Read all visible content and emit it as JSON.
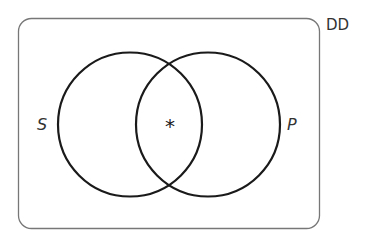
{
  "diagram": {
    "type": "venn",
    "universe_label": "DD",
    "sets": [
      {
        "name": "S",
        "label": "S"
      },
      {
        "name": "P",
        "label": "P"
      }
    ],
    "intersection_marker": "*",
    "colors": {
      "circle_stroke": "#1a1a1a",
      "rect_stroke": "#777777",
      "text": "#333333"
    }
  }
}
